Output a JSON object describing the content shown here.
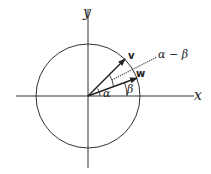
{
  "diagram": {
    "type": "unit-circle-vectors",
    "axes": {
      "x_label": "x",
      "y_label": "y"
    },
    "vectors": [
      {
        "name": "v",
        "label": "v",
        "angle_deg": 38
      },
      {
        "name": "w",
        "label": "w",
        "angle_deg": 20
      }
    ],
    "angles": [
      {
        "label": "α",
        "description": "angle of v from x-axis"
      },
      {
        "label": "β",
        "description": "angle of w from x-axis"
      },
      {
        "label": "α − β",
        "description": "angle between v and w"
      }
    ],
    "colors": {
      "stroke": "#222222",
      "background": "#ffffff"
    }
  }
}
